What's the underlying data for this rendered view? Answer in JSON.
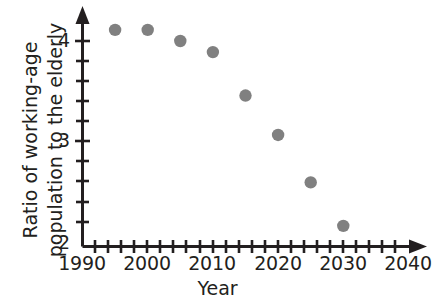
{
  "chart_data": {
    "type": "scatter",
    "title": "",
    "xlabel": "Year",
    "ylabel": "Ratio of working-age population to the elderly",
    "ylabel_line1": "Ratio of working-age",
    "ylabel_line2": "population to the elderly",
    "x": [
      1995,
      2000,
      2005,
      2010,
      2015,
      2020,
      2025,
      2030
    ],
    "values": [
      4.11,
      4.11,
      4.0,
      3.89,
      3.46,
      3.07,
      2.6,
      2.17
    ],
    "points": [
      {
        "year": 1995,
        "ratio": 4.11
      },
      {
        "year": 2000,
        "ratio": 4.11
      },
      {
        "year": 2005,
        "ratio": 4.0
      },
      {
        "year": 2010,
        "ratio": 3.89
      },
      {
        "year": 2015,
        "ratio": 3.46
      },
      {
        "year": 2020,
        "ratio": 3.07
      },
      {
        "year": 2025,
        "ratio": 2.6
      },
      {
        "year": 2030,
        "ratio": 2.17
      }
    ],
    "xlim": [
      1990,
      2042
    ],
    "ylim": [
      2,
      4.35
    ],
    "xticks": [
      1990,
      2000,
      2010,
      2020,
      2030,
      2040
    ],
    "xtick_labels": [
      "1990",
      "2000",
      "2010",
      "2020",
      "2030",
      "2040"
    ],
    "x_minor_tick_step": 2,
    "yticks": [
      2,
      3,
      4
    ],
    "ytick_labels": [
      "2",
      "3",
      "4"
    ],
    "y_minor_tick_step": 0.2,
    "grid": false,
    "legend": null,
    "marker_color": "#808080",
    "axis_color": "#231f20"
  },
  "axis": {
    "y_labels": [
      "4",
      "3",
      "2"
    ],
    "x_labels": [
      "1990",
      "2000",
      "2010",
      "2020",
      "2030",
      "2040"
    ],
    "x_title": "Year",
    "y_title_line1": "Ratio of working-age",
    "y_title_line2": "population to the elderly"
  }
}
